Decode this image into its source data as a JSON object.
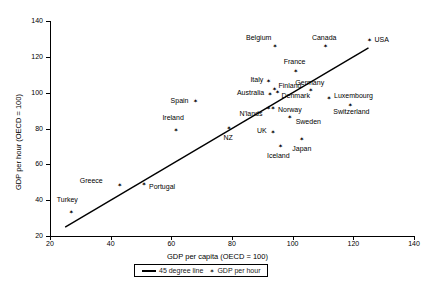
{
  "chart_data": {
    "type": "scatter",
    "title": "",
    "xlabel": "GDP per capita (OECD = 100)",
    "ylabel": "GDP per hour (OECD = 100)",
    "xlim": [
      20,
      140
    ],
    "ylim": [
      20,
      140
    ],
    "xticks": [
      20,
      40,
      60,
      80,
      100,
      120,
      140
    ],
    "yticks": [
      20,
      40,
      60,
      80,
      100,
      120,
      140
    ],
    "grid": false,
    "legend_position": "bottom-center",
    "legend": [
      {
        "label": "45 degree line",
        "kind": "line"
      },
      {
        "label": "GDP per hour",
        "kind": "marker"
      }
    ],
    "reference_line": {
      "label": "45 degree line",
      "x": [
        25,
        125
      ],
      "y": [
        25,
        125
      ]
    },
    "series": [
      {
        "name": "GDP per hour",
        "points": [
          {
            "label": "Turkey",
            "x": 27,
            "y": 33,
            "lx": -4,
            "ly": -13,
            "anchor": "center"
          },
          {
            "label": "Greece",
            "x": 43,
            "y": 48,
            "lx": -17,
            "ly": -5,
            "anchor": "end"
          },
          {
            "label": "Portugal",
            "x": 51,
            "y": 48.5,
            "lx": 5,
            "ly": 2,
            "anchor": "start"
          },
          {
            "label": "Ireland",
            "x": 61.5,
            "y": 79,
            "lx": -3,
            "ly": -12,
            "anchor": "center"
          },
          {
            "label": "Spain",
            "x": 68,
            "y": 95,
            "lx": -7,
            "ly": -1,
            "anchor": "end"
          },
          {
            "label": "NZ",
            "x": 79,
            "y": 80,
            "lx": -1,
            "ly": 9,
            "anchor": "center"
          },
          {
            "label": "N'lands",
            "x": 92,
            "y": 91,
            "lx": -6,
            "ly": 5,
            "anchor": "end"
          },
          {
            "label": "Australia",
            "x": 92.5,
            "y": 99,
            "lx": -6,
            "ly": -1,
            "anchor": "end"
          },
          {
            "label": "Italy",
            "x": 92,
            "y": 106,
            "lx": -5,
            "ly": -2,
            "anchor": "end"
          },
          {
            "label": "Finland",
            "x": 94,
            "y": 102,
            "lx": 4,
            "ly": -3,
            "anchor": "start"
          },
          {
            "label": "Norway",
            "x": 93.5,
            "y": 91,
            "lx": 5,
            "ly": 1,
            "anchor": "start"
          },
          {
            "label": "UK",
            "x": 93.5,
            "y": 78,
            "lx": -6,
            "ly": -1,
            "anchor": "end"
          },
          {
            "label": "Belgium",
            "x": 94.2,
            "y": 126,
            "lx": -4,
            "ly": -8,
            "anchor": "end"
          },
          {
            "label": "Denmark",
            "x": 95,
            "y": 100,
            "lx": 4,
            "ly": 3,
            "anchor": "start"
          },
          {
            "label": "Iceland",
            "x": 96,
            "y": 70,
            "lx": -2,
            "ly": 10,
            "anchor": "center"
          },
          {
            "label": "Sweden",
            "x": 99,
            "y": 86,
            "lx": 6,
            "ly": 4,
            "anchor": "start"
          },
          {
            "label": "France",
            "x": 101,
            "y": 112,
            "lx": -1,
            "ly": -9,
            "anchor": "center"
          },
          {
            "label": "Japan",
            "x": 103,
            "y": 74,
            "lx": 0,
            "ly": 10,
            "anchor": "center"
          },
          {
            "label": "Germany",
            "x": 106,
            "y": 101,
            "lx": -1,
            "ly": -8,
            "anchor": "center"
          },
          {
            "label": "Canada",
            "x": 110.8,
            "y": 126,
            "lx": -1,
            "ly": -8,
            "anchor": "center"
          },
          {
            "label": "Luxembourg",
            "x": 112,
            "y": 97,
            "lx": 5,
            "ly": -2,
            "anchor": "start"
          },
          {
            "label": "Switzerland",
            "x": 119,
            "y": 93,
            "lx": 1,
            "ly": 7,
            "anchor": "center"
          },
          {
            "label": "USA",
            "x": 125.3,
            "y": 129,
            "lx": 5,
            "ly": -1,
            "anchor": "start"
          }
        ]
      }
    ]
  }
}
